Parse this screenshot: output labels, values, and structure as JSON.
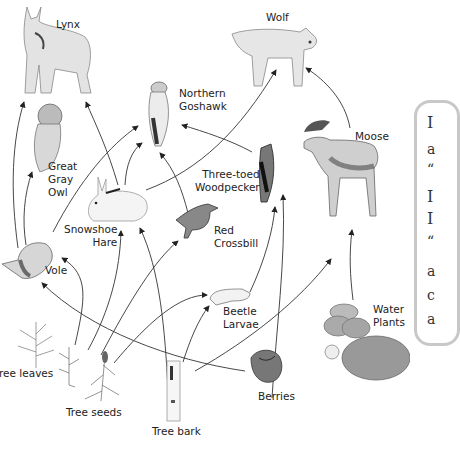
{
  "diagram": {
    "type": "food-web",
    "organisms": [
      {
        "id": "lynx",
        "label": "Lynx"
      },
      {
        "id": "wolf",
        "label": "Wolf"
      },
      {
        "id": "goshawk",
        "label": "Northern\nGoshawk",
        "line1": "Northern",
        "line2": "Goshawk"
      },
      {
        "id": "owl",
        "label": "Great Gray Owl",
        "line1": "Great",
        "line2": "Gray",
        "line3": "Owl"
      },
      {
        "id": "moose",
        "label": "Moose"
      },
      {
        "id": "woodpecker",
        "label": "Three-toed Woodpecker",
        "line1": "Three-toed",
        "line2": "Woodpecker"
      },
      {
        "id": "hare",
        "label": "Snowshoe Hare",
        "line1": "Snowshoe",
        "line2": "Hare"
      },
      {
        "id": "crossbill",
        "label": "Red Crossbill",
        "line1": "Red",
        "line2": "Crossbill"
      },
      {
        "id": "vole",
        "label": "Vole"
      },
      {
        "id": "larvae",
        "label": "Beetle Larvae",
        "line1": "Beetle",
        "line2": "Larvae"
      },
      {
        "id": "water_plants",
        "label": "Water Plants",
        "line1": "Water",
        "line2": "Plants"
      },
      {
        "id": "tree_leaves",
        "label": "Tree leaves",
        "visible_text": "ree leaves"
      },
      {
        "id": "tree_seeds",
        "label": "Tree seeds"
      },
      {
        "id": "tree_bark",
        "label": "Tree bark"
      },
      {
        "id": "berries",
        "label": "Berries"
      }
    ],
    "edges": [
      {
        "from": "vole",
        "to": "lynx"
      },
      {
        "from": "hare",
        "to": "lynx"
      },
      {
        "from": "vole",
        "to": "owl"
      },
      {
        "from": "vole",
        "to": "goshawk"
      },
      {
        "from": "hare",
        "to": "goshawk"
      },
      {
        "from": "crossbill",
        "to": "goshawk"
      },
      {
        "from": "woodpecker",
        "to": "goshawk"
      },
      {
        "from": "hare",
        "to": "wolf"
      },
      {
        "from": "moose",
        "to": "wolf"
      },
      {
        "from": "larvae",
        "to": "woodpecker"
      },
      {
        "from": "berries",
        "to": "woodpecker"
      },
      {
        "from": "tree_seeds",
        "to": "vole"
      },
      {
        "from": "tree_seeds",
        "to": "hare"
      },
      {
        "from": "tree_seeds",
        "to": "crossbill"
      },
      {
        "from": "tree_seeds",
        "to": "larvae"
      },
      {
        "from": "tree_bark",
        "to": "hare"
      },
      {
        "from": "tree_bark",
        "to": "larvae"
      },
      {
        "from": "tree_bark",
        "to": "moose"
      },
      {
        "from": "berries",
        "to": "vole"
      },
      {
        "from": "water_plants",
        "to": "moose"
      }
    ]
  },
  "side_panel": {
    "visible_glyphs": [
      "I",
      "a",
      "“",
      "I",
      "I",
      "“",
      "a",
      "c",
      "a"
    ]
  }
}
